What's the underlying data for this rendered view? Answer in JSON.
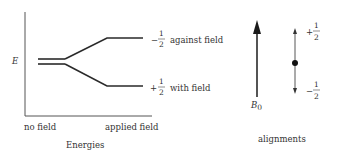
{
  "energy_diagram": {
    "y_axis_label": "E",
    "x_tick_left": "no field",
    "x_tick_right": "applied field",
    "caption": "Energies",
    "levels": [
      {
        "sign": "−",
        "num": "1",
        "den": "2",
        "desc": "against field"
      },
      {
        "sign": "+",
        "num": "1",
        "den": "2",
        "desc": "with field"
      }
    ]
  },
  "alignment_diagram": {
    "field_label": "B",
    "field_subscript": "0",
    "upper_state": {
      "sign": "+",
      "num": "1",
      "den": "2"
    },
    "lower_state": {
      "sign": "−",
      "num": "1",
      "den": "2"
    },
    "caption": "alignments"
  },
  "colors": {
    "line": "#2a2a2a",
    "text": "#333333",
    "background": "#ffffff"
  }
}
